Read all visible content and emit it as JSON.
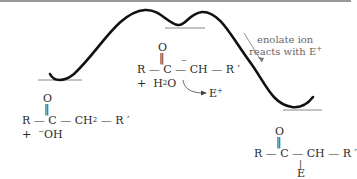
{
  "diagram": {
    "type": "reaction-energy-profile",
    "annotation": {
      "line1": "enolate ion",
      "line2": "reacts with E",
      "line2_sup": "+"
    },
    "reactant": {
      "carbonyl_o": "O",
      "double_bond": "‖",
      "chain": "R — C — CH",
      "sub2": "2",
      "chain_end": " — R ′",
      "plus": "+",
      "ion_charge": "−",
      "ion": "OH"
    },
    "intermediate": {
      "carbonyl_o": "O",
      "double_bond": "‖",
      "carbanion_charge": "−",
      "chain": "R — C — CH — R ′",
      "plus": "+",
      "water": "H",
      "water_sub": "2",
      "water_end": "O",
      "electrophile": "E",
      "electrophile_sup": "+"
    },
    "product": {
      "carbonyl_o": "O",
      "double_bond": "‖",
      "chain": "R — C — CH — R ′",
      "bond_down": "|",
      "substituent": "E"
    }
  }
}
